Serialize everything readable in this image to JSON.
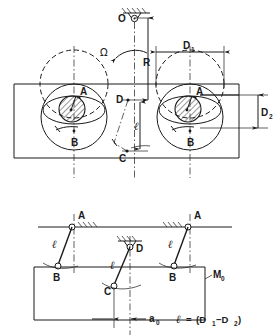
{
  "figure": {
    "background_color": "#ffffff",
    "line_color": "#1a1a1a"
  },
  "upper_diagram": {
    "name": "plan-view-rotating-assembly",
    "pivot_label": "O",
    "rotation_symbol": "Ω",
    "radius_label": "R",
    "dim_d1_label": "D",
    "dim_d1_sub": "1",
    "dim_d2_label": "D",
    "dim_d2_sub": "2",
    "length_label": "ℓ",
    "point_a_label": "A",
    "point_b_label": "B",
    "point_c_label": "C",
    "point_d_label": "D"
  },
  "lower_diagram": {
    "name": "elevation-view-linkage",
    "point_a_left_label": "A",
    "point_a_right_label": "A",
    "point_b_left_label": "B",
    "point_b_right_label": "B",
    "point_c_label": "C",
    "point_d_label": "D",
    "link_length_left_label": "ℓ",
    "link_length_right_label": "ℓ",
    "link_length_center_label": "ℓ",
    "body_label": "M",
    "body_sub": "0",
    "offset_label": "a",
    "offset_sub": "0"
  },
  "equation": {
    "name": "length-relation",
    "lhs": "ℓ",
    "eq": "=",
    "rhs_open": "(D",
    "rhs_sub1": "1",
    "rhs_minus": "−D",
    "rhs_sub2": "2",
    "rhs_close": ")"
  }
}
